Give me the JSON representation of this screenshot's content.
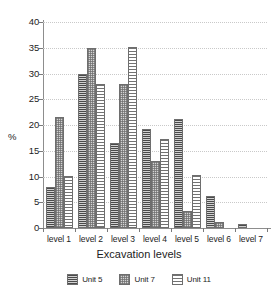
{
  "chart_data": {
    "type": "bar",
    "title": "",
    "xlabel": "Excavation levels",
    "ylabel": "%",
    "ylim": [
      0,
      40
    ],
    "yticks": [
      0,
      5,
      10,
      15,
      20,
      25,
      30,
      35,
      40
    ],
    "ytick_labels": [
      "0",
      "5",
      "10",
      "15",
      "20",
      "25",
      "30",
      "35",
      "40"
    ],
    "grid": true,
    "legend_position": "bottom",
    "categories": [
      "level 1",
      "level 2",
      "level 3",
      "level 4",
      "level 5",
      "level 6",
      "level 7"
    ],
    "series": [
      {
        "name": "Unit 5",
        "pattern": "horizontal-lines-dark",
        "color": "#9a9a9a",
        "values": [
          8.0,
          30.0,
          16.5,
          19.2,
          21.2,
          6.3,
          0.7
        ]
      },
      {
        "name": "Unit 7",
        "pattern": "cross-dot",
        "color": "#d4d4d4",
        "values": [
          21.6,
          35.0,
          28.0,
          13.1,
          3.3,
          1.2,
          0.0
        ]
      },
      {
        "name": "Unit 11",
        "pattern": "horizontal-lines-light",
        "color": "#ffffff",
        "values": [
          10.1,
          28.0,
          35.1,
          17.2,
          10.2,
          0.0,
          0.0
        ]
      }
    ]
  },
  "legend": {
    "items": [
      {
        "label": "Unit 5"
      },
      {
        "label": "Unit 7"
      },
      {
        "label": "Unit 11"
      }
    ]
  },
  "axis": {
    "x_title": "Excavation levels",
    "y_unit": "%"
  }
}
